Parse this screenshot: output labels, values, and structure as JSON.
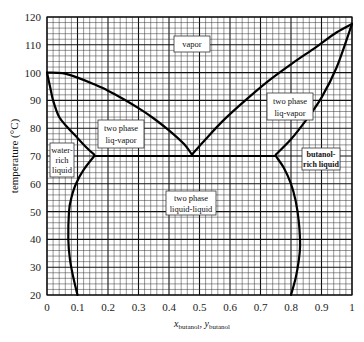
{
  "chart_data": {
    "type": "line",
    "title": "",
    "xlabel": "x_butanol, y_butanol",
    "xlabel_parts": {
      "main1": "x",
      "sub1": "butanol",
      "sep": ", ",
      "main2": "y",
      "sub2": "butanol"
    },
    "ylabel": "temperature (°C)",
    "xlim": [
      0,
      1
    ],
    "ylim": [
      20,
      120
    ],
    "grid": true,
    "x_ticks": [
      "0",
      "0.1",
      "0.2",
      "0.3",
      "0.4",
      "0.5",
      "0.6",
      "0.7",
      "0.8",
      "0.9",
      "1"
    ],
    "y_ticks": [
      "20",
      "30",
      "40",
      "50",
      "60",
      "70",
      "80",
      "90",
      "100",
      "110",
      "120"
    ],
    "series": [
      {
        "name": "dew curve (water side)",
        "x": [
          0.0,
          0.05,
          0.1,
          0.15,
          0.2,
          0.25,
          0.3,
          0.35,
          0.4,
          0.45,
          0.475
        ],
        "y": [
          100.0,
          99.8,
          98.2,
          96.0,
          93.5,
          90.5,
          87.2,
          83.5,
          79.2,
          74.2,
          70.5
        ]
      },
      {
        "name": "bubble curve (water side)",
        "x": [
          0.0,
          0.01,
          0.02,
          0.04,
          0.07,
          0.1,
          0.13,
          0.155
        ],
        "y": [
          100.0,
          95.0,
          90.0,
          84.0,
          80.0,
          76.5,
          73.0,
          70.5
        ]
      },
      {
        "name": "dew curve (butanol side)",
        "x": [
          0.475,
          0.52,
          0.58,
          0.65,
          0.72,
          0.8,
          0.88,
          0.95,
          1.0
        ],
        "y": [
          70.5,
          76.0,
          83.0,
          90.0,
          96.5,
          103.0,
          109.0,
          114.5,
          117.5
        ]
      },
      {
        "name": "bubble curve (butanol side)",
        "x": [
          0.75,
          0.8,
          0.85,
          0.9,
          0.95,
          1.0
        ],
        "y": [
          70.5,
          76.0,
          83.0,
          91.0,
          102.0,
          117.5
        ]
      },
      {
        "name": "three-phase line",
        "x": [
          0.155,
          0.75
        ],
        "y": [
          70.0,
          70.0
        ]
      },
      {
        "name": "water-rich solubility",
        "x": [
          0.155,
          0.12,
          0.095,
          0.08,
          0.072,
          0.07,
          0.075,
          0.085,
          0.1
        ],
        "y": [
          70.0,
          65.0,
          60.0,
          55.0,
          50.0,
          40.0,
          33.0,
          27.0,
          20.0
        ]
      },
      {
        "name": "butanol-rich solubility",
        "x": [
          0.75,
          0.775,
          0.8,
          0.815,
          0.825,
          0.83,
          0.825,
          0.815,
          0.8
        ],
        "y": [
          70.0,
          66.0,
          60.0,
          54.0,
          47.0,
          38.0,
          32.0,
          26.0,
          20.0
        ]
      }
    ],
    "annotations": [
      {
        "text": "vapor",
        "x": 0.47,
        "y": 109
      },
      {
        "text": "two phase liq-vapor",
        "x": 0.23,
        "y": 83
      },
      {
        "text": "two phase liq-vapor",
        "x": 0.81,
        "y": 92
      },
      {
        "text": "water-rich liquid",
        "x": 0.045,
        "y": 72
      },
      {
        "text": "butanol-rich liquid",
        "x": 0.88,
        "y": 71
      },
      {
        "text": "two phase liquid-liquid",
        "x": 0.47,
        "y": 56
      }
    ]
  },
  "labels": {
    "vapor": "vapor",
    "lv_left_1": "two phase",
    "lv_left_2": "liq-vapor",
    "lv_right_1": "two phase",
    "lv_right_2": "liq-vapor",
    "water_1": "water-",
    "water_2": "rich",
    "water_3": "liquid",
    "butanol_1": "butanol-",
    "butanol_2": "rich liquid",
    "ll_1": "two phase",
    "ll_2": "liquid-liquid"
  }
}
